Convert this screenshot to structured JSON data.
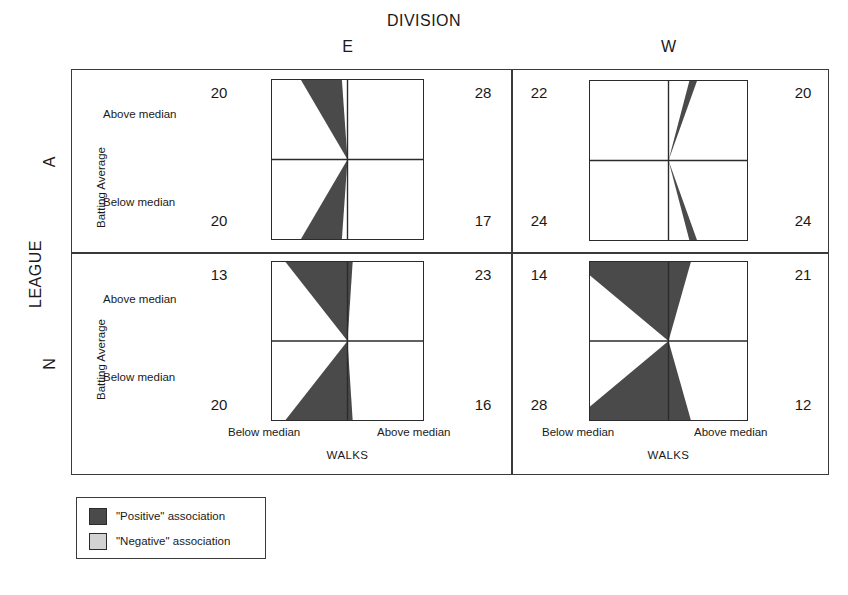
{
  "figure": {
    "column_variable_title": "DIVISION",
    "row_variable_title": "LEAGUE",
    "column_levels": [
      "E",
      "W"
    ],
    "row_levels": [
      "A",
      "N"
    ],
    "x_axis_title": "WALKS",
    "y_axis_title": "Batting Average",
    "x_tick_labels": [
      "Below median",
      "Above median"
    ],
    "y_tick_labels": [
      "Above median",
      "Below median"
    ]
  },
  "legend": {
    "items": [
      {
        "label": "\"Positive\" association",
        "color": "#4a4a4a"
      },
      {
        "label": "\"Negative\" association",
        "color": "#d2d2d2"
      }
    ]
  },
  "colors": {
    "positive": "#4a4a4a",
    "negative": "#d2d2d2",
    "frame": "#3a3a3a",
    "square_border": "#2b2b2b",
    "background": "#ffffff"
  },
  "panels": [
    {
      "id": "a-e",
      "league": "A",
      "division": "E",
      "counts": {
        "top_left": "20",
        "top_right": "28",
        "bottom_left": "20",
        "bottom_right": "17"
      },
      "odds_ratio": 0.607,
      "association": "negative"
    },
    {
      "id": "a-w",
      "league": "A",
      "division": "W",
      "counts": {
        "top_left": "22",
        "top_right": "20",
        "bottom_left": "24",
        "bottom_right": "24"
      },
      "odds_ratio": 1.1,
      "association": "none"
    },
    {
      "id": "n-e",
      "league": "N",
      "division": "E",
      "counts": {
        "top_left": "13",
        "top_right": "23",
        "bottom_left": "20",
        "bottom_right": "16"
      },
      "odds_ratio": 0.452,
      "association": "negative"
    },
    {
      "id": "n-w",
      "league": "N",
      "division": "W",
      "counts": {
        "top_left": "14",
        "top_right": "21",
        "bottom_left": "28",
        "bottom_right": "12"
      },
      "odds_ratio": 0.286,
      "association": "negative"
    }
  ],
  "chart_data": {
    "type": "fourfold",
    "title": "",
    "xlabel": "WALKS",
    "ylabel": "Batting Average",
    "strata_variables": [
      "LEAGUE",
      "DIVISION"
    ],
    "row_variable": "Batting Average",
    "col_variable": "WALKS",
    "row_levels": [
      "Above median",
      "Below median"
    ],
    "col_levels": [
      "Below median",
      "Above median"
    ],
    "legend_position": "bottom-left",
    "cells": [
      {
        "league": "A",
        "division": "E",
        "above_below": 20,
        "above_above": 28,
        "below_below": 20,
        "below_above": 17,
        "odds_ratio": 0.607
      },
      {
        "league": "A",
        "division": "W",
        "above_below": 22,
        "above_above": 20,
        "below_below": 24,
        "below_above": 24,
        "odds_ratio": 1.1
      },
      {
        "league": "N",
        "division": "E",
        "above_below": 13,
        "above_above": 23,
        "below_below": 20,
        "below_above": 16,
        "odds_ratio": 0.452
      },
      {
        "league": "N",
        "division": "W",
        "above_below": 14,
        "above_above": 21,
        "below_below": 28,
        "below_above": 12,
        "odds_ratio": 0.286
      }
    ]
  }
}
